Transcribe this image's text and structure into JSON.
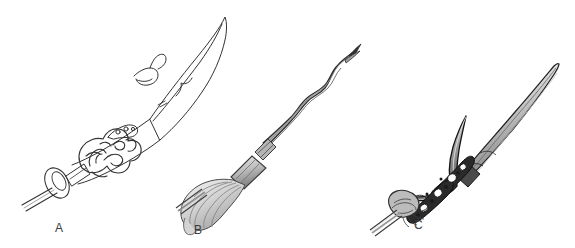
{
  "plate": {
    "title": "",
    "background_color": "#ffffff",
    "ink_color": "#2b2b2b",
    "width": 575,
    "height": 248,
    "medium": "pen-and-ink line drawing with graphite shading",
    "subject": "three ornate Chinese polearm weapon heads"
  },
  "figures": [
    {
      "id": "A",
      "label": "A",
      "name": "curved glaive blade with dragon-head collar",
      "style": "pure outline, no shading",
      "parts": [
        "broad single-edged crescent blade",
        "small hooked back-flange near blade base",
        "openwork dragon-head collar ornament",
        "round disc guard",
        "short shaft section"
      ],
      "orientation": "diagonal, tip toward upper right"
    },
    {
      "id": "B",
      "label": "B",
      "name": "flame-bladed (wavy) spear with horsehair plume",
      "style": "outline with light graphite shading",
      "parts": [
        "serpentine wavy double-edged blade",
        "forked blade tip",
        "bound collar / ferrule",
        "tapered socket",
        "horsehair tassel plume",
        "round shaft"
      ],
      "orientation": "diagonal, tip toward upper right"
    },
    {
      "id": "C",
      "label": "C",
      "name": "crescent-moon halberd with slender spear point",
      "style": "outline with heavy dark ink detailing",
      "parts": [
        "long slender spear point",
        "upward-curving crescent moon blade",
        "pierced openwork ornamental bracket",
        "beaded chain-like decoration",
        "phoenix/bird head socket ornament",
        "round shaft"
      ],
      "orientation": "diagonal, tip toward upper right"
    }
  ],
  "labels": {
    "a": "A",
    "b": "B",
    "c": "C"
  }
}
